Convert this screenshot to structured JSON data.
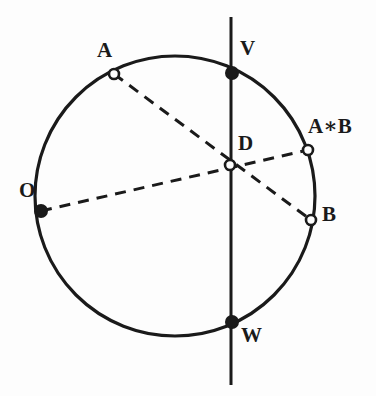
{
  "figure": {
    "type": "geometric-diagram",
    "canvas": {
      "width": 376,
      "height": 396
    },
    "background_color": "#fdfdfd",
    "ink_color": "#1a1a1a"
  },
  "circle": {
    "name": "main-circle",
    "cx": 175,
    "cy": 196,
    "r": 140,
    "stroke_width": 3.2,
    "stroke_color": "#1a1a1a",
    "fill": "none"
  },
  "axis_line": {
    "name": "vertical-axis-line",
    "x": 231,
    "y_top": 17,
    "y_bottom": 385,
    "stroke_width": 3.0,
    "stroke_color": "#1a1a1a"
  },
  "chords": [
    {
      "name": "chord-A-B",
      "from": "A",
      "to": "B",
      "through": "D",
      "x1": 114,
      "y1": 74,
      "x2": 311,
      "y2": 220,
      "style": "dashed",
      "dash_pattern": "11 8",
      "stroke_width": 3.0,
      "stroke_color": "#1a1a1a"
    },
    {
      "name": "chord-O-AstarB",
      "from": "O",
      "to": "A*B",
      "through": "D",
      "x1": 41,
      "y1": 211,
      "x2": 308,
      "y2": 150,
      "style": "dashed",
      "dash_pattern": "11 8",
      "stroke_width": 3.0,
      "stroke_color": "#1a1a1a"
    }
  ],
  "points": [
    {
      "id": "A",
      "label": "A",
      "x": 114,
      "y": 74,
      "marker": "open",
      "radius": 5.0,
      "label_x": 97,
      "label_y": 40
    },
    {
      "id": "V",
      "label": "V",
      "x": 232,
      "y": 73,
      "marker": "filled",
      "radius": 6.0,
      "label_x": 240,
      "label_y": 38
    },
    {
      "id": "AstarB",
      "label": "A∗B",
      "x": 308,
      "y": 150,
      "marker": "open",
      "radius": 5.0,
      "label_x": 308,
      "label_y": 116
    },
    {
      "id": "D",
      "label": "D",
      "x": 230,
      "y": 165,
      "marker": "open",
      "radius": 5.0,
      "label_x": 238,
      "label_y": 133
    },
    {
      "id": "O",
      "label": "O",
      "x": 41,
      "y": 211,
      "marker": "filled",
      "radius": 6.0,
      "label_x": 19,
      "label_y": 180
    },
    {
      "id": "B",
      "label": "B",
      "x": 311,
      "y": 220,
      "marker": "open",
      "radius": 5.0,
      "label_x": 322,
      "label_y": 204
    },
    {
      "id": "W",
      "label": "W",
      "x": 232,
      "y": 322,
      "marker": "filled",
      "radius": 6.0,
      "label_x": 241,
      "label_y": 325
    }
  ]
}
